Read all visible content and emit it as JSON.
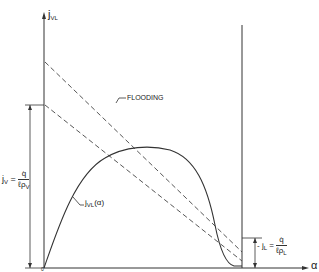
{
  "diagram": {
    "y_axis_label": {
      "main": "j",
      "sub": "VL"
    },
    "x_axis_label": "α",
    "origin_label": "0",
    "curve_label": {
      "main": "j",
      "sub": "VL",
      "arg": "(α)"
    },
    "flooding_label": "FLOODING",
    "vapor_limit": {
      "lhs_main": "j",
      "lhs_sub": "V",
      "eq": "=",
      "num": "q̇",
      "den_main": "ℓρ",
      "den_sub": "V"
    },
    "liquid_limit": {
      "lhs_prefix": "-",
      "lhs_main": "j",
      "lhs_sub": "L",
      "eq": "=",
      "num": "q̇",
      "den_main": "ℓρ",
      "den_sub": "L"
    },
    "colors": {
      "line": "#333333",
      "dashed": "#444444",
      "background": "#ffffff"
    }
  }
}
